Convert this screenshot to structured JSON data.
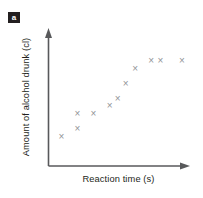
{
  "figure": {
    "part_label": "a",
    "background_color": "#ffffff",
    "axis_color": "#58595b",
    "marker_color": "#939598",
    "text_color": "#231f20"
  },
  "chart_data": {
    "type": "scatter",
    "title": "",
    "xlabel": "Reaction time (s)",
    "ylabel": "Amount of alcohol drunk (cl)",
    "xticklabels": [],
    "yticklabels": [],
    "grid": false,
    "legend": false,
    "marker": "x",
    "marker_color": "#939598",
    "axis_arrows": true,
    "xlim": [
      0,
      1
    ],
    "ylim": [
      0,
      1
    ],
    "n_points": 11,
    "relationship": "positive correlation",
    "points": [
      {
        "x": 0.07,
        "y": 0.21
      },
      {
        "x": 0.19,
        "y": 0.28
      },
      {
        "x": 0.19,
        "y": 0.41
      },
      {
        "x": 0.31,
        "y": 0.41
      },
      {
        "x": 0.43,
        "y": 0.48
      },
      {
        "x": 0.49,
        "y": 0.54
      },
      {
        "x": 0.55,
        "y": 0.67
      },
      {
        "x": 0.62,
        "y": 0.8
      },
      {
        "x": 0.74,
        "y": 0.87
      },
      {
        "x": 0.81,
        "y": 0.87
      },
      {
        "x": 0.97,
        "y": 0.87
      }
    ]
  }
}
